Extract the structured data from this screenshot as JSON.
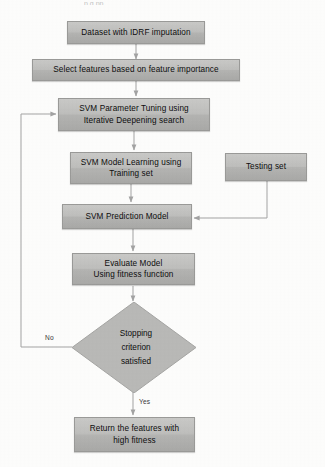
{
  "figure": {
    "type": "flowchart",
    "title_fragment_cut_off_at_top": "p g pp",
    "orientation": "top-to-bottom",
    "background_color": "#fdfdfc",
    "node_fill_color": "#bebebc",
    "node_border_color": "#9a9a98",
    "connector_color": "#9d9d9d",
    "text_color": "#0d0d0d"
  },
  "nodes": [
    {
      "id": "dataset",
      "shape": "process",
      "lines": [
        "Dataset with IDRF imputation"
      ]
    },
    {
      "id": "select-features",
      "shape": "process",
      "lines": [
        "Select features based on feature importance"
      ]
    },
    {
      "id": "param-tuning",
      "shape": "process",
      "lines": [
        "SVM Parameter Tuning using",
        "Iterative Deepening search"
      ]
    },
    {
      "id": "model-learning",
      "shape": "process",
      "lines": [
        "SVM Model Learning using",
        "Training set"
      ]
    },
    {
      "id": "testing-set",
      "shape": "process",
      "lines": [
        "Testing set"
      ]
    },
    {
      "id": "prediction-model",
      "shape": "process",
      "lines": [
        "SVM Prediction Model"
      ]
    },
    {
      "id": "evaluate-model",
      "shape": "process",
      "lines": [
        "Evaluate Model",
        "Using fitness function"
      ]
    },
    {
      "id": "stopping-criterion",
      "shape": "decision",
      "lines": [
        "Stopping",
        "criterion",
        "satisfied"
      ]
    },
    {
      "id": "return-features",
      "shape": "process",
      "lines": [
        "Return the features with",
        "high fitness"
      ]
    }
  ],
  "edge_labels": {
    "no": "No",
    "yes": "Yes"
  }
}
